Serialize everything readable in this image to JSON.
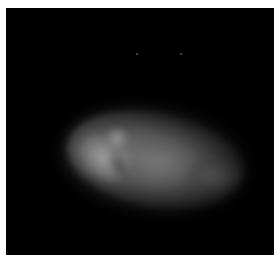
{
  "image": {
    "subject": "fluorescence micrograph of a single cell nucleus",
    "colors": {
      "background": "#000000",
      "border": "#ffffff",
      "signal": "#a0a0a0"
    },
    "features": [
      {
        "name": "nucleus-blob",
        "description": "elongated grayscale blob, brightest along left edge"
      },
      {
        "name": "speck",
        "description": "faint point"
      },
      {
        "name": "speck",
        "description": "faint point"
      }
    ]
  }
}
